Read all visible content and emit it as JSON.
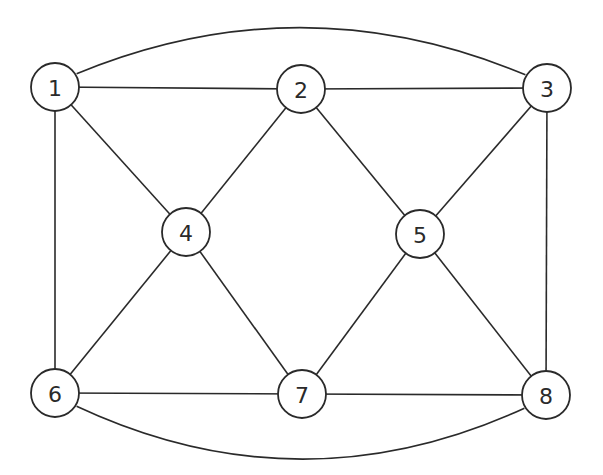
{
  "diagram": {
    "type": "graph",
    "stroke_color": "#2a2a2a",
    "background": "#ffffff",
    "node_radius": 24,
    "nodes": [
      {
        "id": "1",
        "label": "1",
        "x": 55,
        "y": 87
      },
      {
        "id": "2",
        "label": "2",
        "x": 301,
        "y": 89
      },
      {
        "id": "3",
        "label": "3",
        "x": 547,
        "y": 88
      },
      {
        "id": "4",
        "label": "4",
        "x": 186,
        "y": 232
      },
      {
        "id": "5",
        "label": "5",
        "x": 420,
        "y": 234
      },
      {
        "id": "6",
        "label": "6",
        "x": 55,
        "y": 393
      },
      {
        "id": "7",
        "label": "7",
        "x": 302,
        "y": 394
      },
      {
        "id": "8",
        "label": "8",
        "x": 546,
        "y": 395
      }
    ],
    "edges": [
      {
        "from": "1",
        "to": "2",
        "curve": "straight"
      },
      {
        "from": "2",
        "to": "3",
        "curve": "straight"
      },
      {
        "from": "1",
        "to": "3",
        "curve": "arc-top"
      },
      {
        "from": "1",
        "to": "4",
        "curve": "straight"
      },
      {
        "from": "1",
        "to": "6",
        "curve": "straight"
      },
      {
        "from": "2",
        "to": "4",
        "curve": "straight"
      },
      {
        "from": "2",
        "to": "5",
        "curve": "straight"
      },
      {
        "from": "3",
        "to": "5",
        "curve": "straight"
      },
      {
        "from": "3",
        "to": "8",
        "curve": "straight"
      },
      {
        "from": "4",
        "to": "6",
        "curve": "straight"
      },
      {
        "from": "4",
        "to": "7",
        "curve": "straight"
      },
      {
        "from": "5",
        "to": "7",
        "curve": "straight"
      },
      {
        "from": "5",
        "to": "8",
        "curve": "straight"
      },
      {
        "from": "6",
        "to": "7",
        "curve": "straight"
      },
      {
        "from": "7",
        "to": "8",
        "curve": "straight"
      },
      {
        "from": "6",
        "to": "8",
        "curve": "arc-bottom"
      }
    ]
  }
}
